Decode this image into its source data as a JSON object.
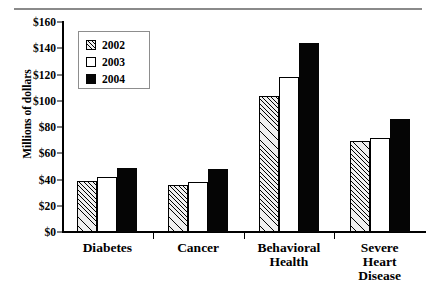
{
  "chart_data": {
    "type": "bar",
    "title": "",
    "xlabel": "",
    "ylabel": "Millions of dollars",
    "ylim": [
      0,
      160
    ],
    "ytick_step": 20,
    "ytick_labels": [
      "$0",
      "$20",
      "$40",
      "$60",
      "$80",
      "$100",
      "$120",
      "$140",
      "$160"
    ],
    "ytick_values": [
      0,
      20,
      40,
      60,
      80,
      100,
      120,
      140,
      160
    ],
    "grid": false,
    "legend_position": "upper-left-inside",
    "categories": [
      "Diabetes",
      "Cancer",
      "Behavioral Health",
      "Severe Heart Disease"
    ],
    "category_lines": [
      [
        "Diabetes"
      ],
      [
        "Cancer"
      ],
      [
        "Behavioral",
        "Health"
      ],
      [
        "Severe",
        "Heart",
        "Disease"
      ]
    ],
    "series": [
      {
        "name": "2002",
        "fill": "hatched",
        "color": "#efefef",
        "values": [
          39,
          36,
          104,
          69
        ]
      },
      {
        "name": "2003",
        "fill": "solid-white",
        "color": "#ffffff",
        "values": [
          42,
          38,
          118,
          72
        ]
      },
      {
        "name": "2004",
        "fill": "solid-black",
        "color": "#050505",
        "values": [
          49,
          48,
          144,
          86
        ]
      }
    ]
  },
  "legend": {
    "items": [
      {
        "label": "2002"
      },
      {
        "label": "2003"
      },
      {
        "label": "2004"
      }
    ]
  }
}
